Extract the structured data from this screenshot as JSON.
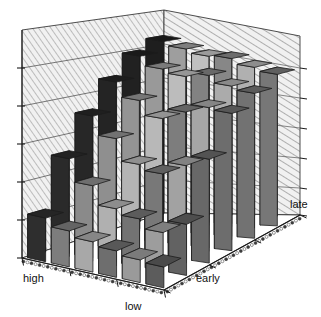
{
  "chart_data": {
    "type": "bar",
    "subtype": "3d-perspective-bar",
    "title": "",
    "subtitle": "",
    "xlabel": "",
    "ylabel": "",
    "zlabel": "",
    "axis_labels": {
      "left_front_near": "high",
      "left_front_far": "low",
      "right_front_near": "early",
      "right_front_far": "late"
    },
    "row_categories": [
      "early",
      "",
      "",
      "",
      "",
      "late"
    ],
    "col_categories": [
      "high",
      "",
      "",
      "",
      "",
      "low"
    ],
    "grid": true,
    "legend": "none",
    "zlim": [
      0,
      6
    ],
    "z_ticks": [
      0,
      1,
      2,
      3,
      4,
      5
    ],
    "z_tick_labels": [
      "",
      "",
      "",
      "",
      "",
      ""
    ],
    "note": "Rows run front (early) to back (late); columns run left (high) to right (low). Values are bar heights in arbitrary units read off the 6 gridline divisions.",
    "series": [
      {
        "name": "early",
        "values": [
          1.15,
          0.95,
          0.8,
          0.7,
          0.6,
          0.55
        ]
      },
      {
        "name": "row2",
        "values": [
          2.55,
          1.95,
          1.45,
          1.3,
          1.05,
          1.4
        ]
      },
      {
        "name": "row3",
        "values": [
          3.55,
          3.05,
          2.45,
          2.3,
          2.65,
          2.95
        ]
      },
      {
        "name": "row4",
        "values": [
          4.35,
          3.95,
          3.55,
          3.85,
          4.1,
          4.05
        ]
      },
      {
        "name": "row5",
        "values": [
          4.95,
          4.7,
          4.6,
          4.75,
          4.55,
          4.45
        ]
      },
      {
        "name": "late",
        "values": [
          5.25,
          5.15,
          5.05,
          5.1,
          4.95,
          4.85
        ]
      }
    ],
    "bar_shades": [
      [
        "#2e2e2e",
        "#7d7d7d",
        "#a8a8a8",
        "#6e6e6e",
        "#9a9a9a",
        "#5c5c5c"
      ],
      [
        "#2a2a2a",
        "#8a8a8a",
        "#b0b0b0",
        "#737373",
        "#9d9d9d",
        "#626262"
      ],
      [
        "#272727",
        "#8f8f8f",
        "#b4b4b4",
        "#787878",
        "#a2a2a2",
        "#686868"
      ],
      [
        "#242424",
        "#949494",
        "#b8b8b8",
        "#7d7d7d",
        "#a6a6a6",
        "#6d6d6d"
      ],
      [
        "#212121",
        "#999999",
        "#bcbcbc",
        "#828282",
        "#ababab",
        "#727272"
      ],
      [
        "#1e1e1e",
        "#9e9e9e",
        "#c0c0c0",
        "#878787",
        "#b0b0b0",
        "#777777"
      ]
    ]
  },
  "colors": {
    "background": "#ffffff",
    "wall_fill": "#f2f2f2",
    "wall_hatch": "#8d8d8d",
    "wall_edge": "#3a3a3a",
    "gridline": "#555555",
    "floor": "#ffffff",
    "floor_border_dark": "#3c3c3c",
    "floor_border_light": "#ffffff",
    "axis_line": "#1a1a1a",
    "tick": "#1a1a1a",
    "label_text": "#111111",
    "bar_dark": "#2a2a2a",
    "bar_mid": "#8a8a8a",
    "bar_light": "#bcbcbc"
  },
  "geometry": {
    "projection": "oblique-perspective",
    "rows": 6,
    "cols": 6
  }
}
